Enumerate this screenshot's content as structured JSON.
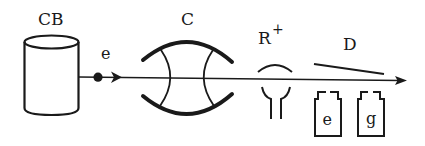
{
  "diagram": {
    "type": "schematic",
    "colors": {
      "ink": "#1a1a1a",
      "background": "#ffffff"
    },
    "components": [
      {
        "id": "CB",
        "label": "CB",
        "shape": "cylinder"
      },
      {
        "id": "e_beam",
        "label": "e",
        "shape": "dot-arrow"
      },
      {
        "id": "C",
        "label": "C",
        "shape": "cavity"
      },
      {
        "id": "R",
        "label": "R",
        "superscript": "+",
        "shape": "ring-stem"
      },
      {
        "id": "D",
        "label": "D",
        "shape": "plate-detectors",
        "detectors": [
          {
            "label": "e"
          },
          {
            "label": "g"
          }
        ]
      }
    ],
    "connections": [
      {
        "from": "CB",
        "to": "D",
        "kind": "beam-arrow"
      }
    ]
  }
}
